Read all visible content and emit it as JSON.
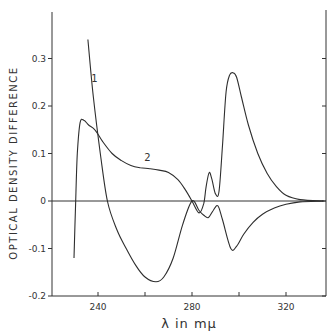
{
  "chart_data": {
    "type": "line",
    "title": "",
    "xlabel": "λ in mμ",
    "ylabel": "OPTICAL DENSITY DIFFERENCE",
    "xlim": [
      220,
      336
    ],
    "ylim": [
      -0.2,
      0.37
    ],
    "x_ticks": [
      240,
      260,
      280,
      300,
      320
    ],
    "x_tick_labels": [
      "240",
      "",
      "280",
      "",
      "320"
    ],
    "y_ticks": [
      -0.2,
      -0.1,
      0,
      0.1,
      0.2,
      0.3
    ],
    "y_tick_labels": [
      "-0.2",
      "-0.1",
      "0",
      "0.1",
      "0.2",
      "0.3"
    ],
    "zero_line": true,
    "grid": false,
    "legend": "none (inline curve labels)",
    "series": [
      {
        "name": "1",
        "x": [
          235.7,
          238,
          241,
          244,
          248,
          252,
          256,
          260,
          264.7,
          268,
          272,
          276,
          280,
          283,
          285,
          287,
          289,
          291,
          293,
          296.5,
          299,
          302,
          306,
          310,
          315,
          320,
          326,
          336
        ],
        "y": [
          0.34,
          0.22,
          0.1,
          0.0,
          -0.06,
          -0.1,
          -0.135,
          -0.16,
          -0.17,
          -0.16,
          -0.12,
          -0.05,
          0.0,
          -0.02,
          -0.03,
          -0.035,
          -0.02,
          -0.01,
          -0.04,
          -0.1,
          -0.095,
          -0.07,
          -0.045,
          -0.028,
          -0.015,
          -0.007,
          -0.002,
          0.0
        ]
      },
      {
        "name": "2",
        "x": [
          229.8,
          230.5,
          231.2,
          232.4,
          234,
          236,
          238.7,
          242,
          246,
          250,
          254,
          258,
          262,
          266,
          270,
          274,
          277,
          280,
          283,
          285,
          286,
          287.3,
          288.5,
          290,
          291.5,
          293,
          294.5,
          296,
          297.5,
          299,
          301,
          304,
          308,
          312,
          316,
          320,
          326,
          336
        ],
        "y": [
          -0.12,
          0.0,
          0.1,
          0.165,
          0.17,
          0.16,
          0.15,
          0.125,
          0.1,
          0.085,
          0.075,
          0.07,
          0.068,
          0.065,
          0.06,
          0.045,
          0.025,
          0.0,
          -0.025,
          -0.005,
          0.03,
          0.06,
          0.045,
          0.015,
          0.02,
          0.12,
          0.23,
          0.265,
          0.27,
          0.26,
          0.22,
          0.16,
          0.1,
          0.058,
          0.03,
          0.012,
          0.003,
          0.0
        ]
      }
    ],
    "annotations": [
      {
        "text": "1",
        "x": 238.5,
        "y": 0.25
      },
      {
        "text": "2",
        "x": 261,
        "y": 0.085
      }
    ]
  }
}
